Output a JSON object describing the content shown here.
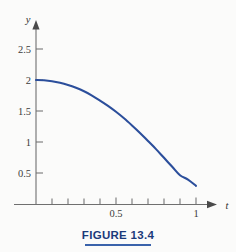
{
  "figure": {
    "caption": "FIGURE 13.4",
    "caption_color": "#1b3a7a",
    "rule_color": "#3a63ab",
    "background_color": "#fbfbfa"
  },
  "chart_data": {
    "type": "line",
    "title": "",
    "xlabel": "t",
    "ylabel": "y",
    "xlim": [
      0,
      1.12
    ],
    "ylim": [
      0,
      2.75
    ],
    "grid": false,
    "legend": null,
    "series": [
      {
        "name": "y(t)",
        "color": "#2b4e9b",
        "line_width": 2.1,
        "x": [
          0.0,
          0.05,
          0.1,
          0.15,
          0.2,
          0.25,
          0.3,
          0.35,
          0.4,
          0.45,
          0.5,
          0.55,
          0.6,
          0.65,
          0.7,
          0.75,
          0.8,
          0.85,
          0.9,
          0.95,
          1.0
        ],
        "y": [
          2.0,
          1.995,
          1.98,
          1.955,
          1.92,
          1.875,
          1.82,
          1.75,
          1.67,
          1.585,
          1.49,
          1.385,
          1.27,
          1.15,
          1.02,
          0.89,
          0.75,
          0.61,
          0.47,
          0.4,
          0.3
        ]
      }
    ],
    "x_ticks_major": [
      {
        "value": 0.5,
        "label": "0.5"
      },
      {
        "value": 1.0,
        "label": "1"
      }
    ],
    "x_ticks_minor": [
      0.1,
      0.2,
      0.3,
      0.4,
      0.6,
      0.7,
      0.8,
      0.9
    ],
    "y_ticks_major": [
      {
        "value": 2.5,
        "label": "2.5"
      },
      {
        "value": 2.0,
        "label": "2"
      },
      {
        "value": 1.5,
        "label": "1.5"
      },
      {
        "value": 1.0,
        "label": "1"
      },
      {
        "value": 0.5,
        "label": "0.5"
      }
    ],
    "axis_color": "#6f6f6f",
    "tick_label_color": "#3b3b3b"
  }
}
